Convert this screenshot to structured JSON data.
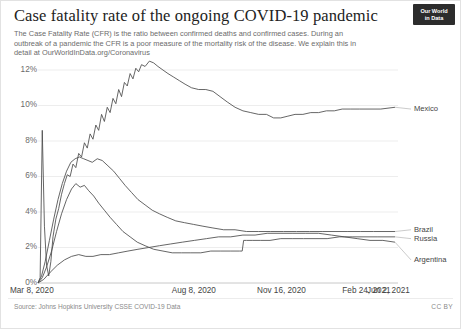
{
  "header": {
    "title": "Case fatality rate of the ongoing COVID-19 pandemic",
    "subtitle": "The Case Fatality Rate (CFR) is the ratio between confirmed deaths and confirmed cases. During an outbreak of a pandemic the CFR is a poor measure of the mortality risk of the disease. We explain this in detail at OurWorldInData.org/Coronavirus",
    "logo_line1": "Our World",
    "logo_line2": "in Data"
  },
  "footer": {
    "source": "Source: Johns Hopkins University CSSE COVID-19 Data",
    "license": "CC BY"
  },
  "chart_data": {
    "type": "line",
    "title": "Case fatality rate of the ongoing COVID-19 pandemic",
    "xlabel": "",
    "ylabel": "",
    "ylim": [
      0,
      13.2
    ],
    "grid": "horizontal",
    "legend_position": "right-of-lines",
    "ytick_labels": [
      "0%",
      "2%",
      "4%",
      "6%",
      "8%",
      "10%",
      "12%"
    ],
    "ytick_values": [
      0,
      2,
      4,
      6,
      8,
      10,
      12
    ],
    "xtick_labels": [
      "Mar 8, 2020",
      "Aug 8, 2020",
      "Nov 16, 2020",
      "Feb 24, 2021",
      "Jun 2, 2021"
    ],
    "xtick_positions": [
      0,
      0.453,
      0.692,
      0.931,
      1.0
    ],
    "color": "#4a4a4a",
    "series": [
      {
        "name": "Mexico",
        "label_y_pct": 9.8,
        "points": [
          [
            0.0,
            0.0
          ],
          [
            0.006,
            0.3
          ],
          [
            0.012,
            8.6
          ],
          [
            0.018,
            3.2
          ],
          [
            0.024,
            1.0
          ],
          [
            0.03,
            0.4
          ],
          [
            0.036,
            1.2
          ],
          [
            0.042,
            2.6
          ],
          [
            0.05,
            3.6
          ],
          [
            0.058,
            4.2
          ],
          [
            0.066,
            5.0
          ],
          [
            0.074,
            5.6
          ],
          [
            0.082,
            6.1
          ],
          [
            0.09,
            6.0
          ],
          [
            0.098,
            6.7
          ],
          [
            0.106,
            6.5
          ],
          [
            0.114,
            7.3
          ],
          [
            0.122,
            7.1
          ],
          [
            0.13,
            7.9
          ],
          [
            0.138,
            7.6
          ],
          [
            0.146,
            8.4
          ],
          [
            0.154,
            8.1
          ],
          [
            0.162,
            8.9
          ],
          [
            0.17,
            8.6
          ],
          [
            0.178,
            9.5
          ],
          [
            0.186,
            9.1
          ],
          [
            0.194,
            9.9
          ],
          [
            0.202,
            9.6
          ],
          [
            0.21,
            10.4
          ],
          [
            0.218,
            10.1
          ],
          [
            0.226,
            10.9
          ],
          [
            0.234,
            10.5
          ],
          [
            0.242,
            11.3
          ],
          [
            0.25,
            11.1
          ],
          [
            0.258,
            11.8
          ],
          [
            0.266,
            11.5
          ],
          [
            0.274,
            12.1
          ],
          [
            0.282,
            11.9
          ],
          [
            0.29,
            12.3
          ],
          [
            0.3,
            12.2
          ],
          [
            0.312,
            12.5
          ],
          [
            0.324,
            12.4
          ],
          [
            0.336,
            12.2
          ],
          [
            0.35,
            12.0
          ],
          [
            0.364,
            11.8
          ],
          [
            0.38,
            11.6
          ],
          [
            0.396,
            11.4
          ],
          [
            0.412,
            11.2
          ],
          [
            0.43,
            11.0
          ],
          [
            0.45,
            10.9
          ],
          [
            0.47,
            10.9
          ],
          [
            0.49,
            10.8
          ],
          [
            0.51,
            10.5
          ],
          [
            0.53,
            10.2
          ],
          [
            0.552,
            9.9
          ],
          [
            0.574,
            9.7
          ],
          [
            0.596,
            9.6
          ],
          [
            0.618,
            9.5
          ],
          [
            0.64,
            9.5
          ],
          [
            0.66,
            9.3
          ],
          [
            0.68,
            9.3
          ],
          [
            0.7,
            9.4
          ],
          [
            0.72,
            9.5
          ],
          [
            0.742,
            9.5
          ],
          [
            0.764,
            9.6
          ],
          [
            0.786,
            9.6
          ],
          [
            0.808,
            9.7
          ],
          [
            0.83,
            9.7
          ],
          [
            0.852,
            9.8
          ],
          [
            0.876,
            9.8
          ],
          [
            0.9,
            9.8
          ],
          [
            0.93,
            9.8
          ],
          [
            0.96,
            9.8
          ],
          [
            1.0,
            9.9
          ]
        ]
      },
      {
        "name": "Brazil",
        "label_y_pct": 3.0,
        "points": [
          [
            0.0,
            0.0
          ],
          [
            0.01,
            0.4
          ],
          [
            0.02,
            1.2
          ],
          [
            0.032,
            2.4
          ],
          [
            0.044,
            3.6
          ],
          [
            0.056,
            4.7
          ],
          [
            0.068,
            5.6
          ],
          [
            0.08,
            6.3
          ],
          [
            0.092,
            6.8
          ],
          [
            0.104,
            7.0
          ],
          [
            0.116,
            7.1
          ],
          [
            0.128,
            7.0
          ],
          [
            0.14,
            6.9
          ],
          [
            0.152,
            6.8
          ],
          [
            0.166,
            7.0
          ],
          [
            0.18,
            6.9
          ],
          [
            0.196,
            6.6
          ],
          [
            0.212,
            6.3
          ],
          [
            0.228,
            5.9
          ],
          [
            0.244,
            5.5
          ],
          [
            0.262,
            5.1
          ],
          [
            0.28,
            4.7
          ],
          [
            0.3,
            4.4
          ],
          [
            0.32,
            4.1
          ],
          [
            0.34,
            3.9
          ],
          [
            0.362,
            3.7
          ],
          [
            0.386,
            3.5
          ],
          [
            0.41,
            3.4
          ],
          [
            0.436,
            3.3
          ],
          [
            0.462,
            3.2
          ],
          [
            0.49,
            3.1
          ],
          [
            0.52,
            3.0
          ],
          [
            0.552,
            3.0
          ],
          [
            0.584,
            2.9
          ],
          [
            0.618,
            2.9
          ],
          [
            0.652,
            2.9
          ],
          [
            0.688,
            2.9
          ],
          [
            0.724,
            2.9
          ],
          [
            0.76,
            2.9
          ],
          [
            0.796,
            2.9
          ],
          [
            0.832,
            2.9
          ],
          [
            0.868,
            2.9
          ],
          [
            0.904,
            2.9
          ],
          [
            0.94,
            2.9
          ],
          [
            1.0,
            2.9
          ]
        ]
      },
      {
        "name": "Russia",
        "label_y_pct": 2.5,
        "points": [
          [
            0.0,
            0.0
          ],
          [
            0.012,
            0.3
          ],
          [
            0.024,
            0.9
          ],
          [
            0.038,
            1.8
          ],
          [
            0.052,
            2.9
          ],
          [
            0.066,
            3.9
          ],
          [
            0.08,
            4.7
          ],
          [
            0.094,
            5.3
          ],
          [
            0.106,
            5.6
          ],
          [
            0.118,
            5.4
          ],
          [
            0.13,
            5.5
          ],
          [
            0.142,
            5.2
          ],
          [
            0.156,
            4.9
          ],
          [
            0.17,
            4.5
          ],
          [
            0.186,
            4.1
          ],
          [
            0.202,
            3.7
          ],
          [
            0.22,
            3.3
          ],
          [
            0.238,
            2.9
          ],
          [
            0.258,
            2.6
          ],
          [
            0.278,
            2.3
          ],
          [
            0.3,
            2.1
          ],
          [
            0.324,
            1.9
          ],
          [
            0.35,
            1.8
          ],
          [
            0.376,
            1.7
          ],
          [
            0.402,
            1.7
          ],
          [
            0.428,
            1.7
          ],
          [
            0.456,
            1.7
          ],
          [
            0.484,
            1.8
          ],
          [
            0.512,
            1.8
          ],
          [
            0.54,
            1.8
          ],
          [
            0.564,
            1.8
          ],
          [
            0.572,
            1.8
          ],
          [
            0.576,
            2.4
          ],
          [
            0.584,
            2.4
          ],
          [
            0.6,
            2.4
          ],
          [
            0.624,
            2.4
          ],
          [
            0.65,
            2.4
          ],
          [
            0.68,
            2.5
          ],
          [
            0.712,
            2.5
          ],
          [
            0.744,
            2.5
          ],
          [
            0.776,
            2.5
          ],
          [
            0.81,
            2.5
          ],
          [
            0.844,
            2.6
          ],
          [
            0.88,
            2.6
          ],
          [
            0.916,
            2.6
          ],
          [
            0.952,
            2.6
          ],
          [
            1.0,
            2.6
          ]
        ]
      },
      {
        "name": "Argentina",
        "label_y_pct": 1.3,
        "points": [
          [
            0.0,
            0.0
          ],
          [
            0.016,
            0.2
          ],
          [
            0.034,
            0.6
          ],
          [
            0.054,
            1.0
          ],
          [
            0.074,
            1.3
          ],
          [
            0.094,
            1.5
          ],
          [
            0.114,
            1.6
          ],
          [
            0.134,
            1.5
          ],
          [
            0.154,
            1.5
          ],
          [
            0.176,
            1.6
          ],
          [
            0.2,
            1.6
          ],
          [
            0.226,
            1.7
          ],
          [
            0.252,
            1.8
          ],
          [
            0.28,
            1.9
          ],
          [
            0.31,
            2.0
          ],
          [
            0.34,
            2.1
          ],
          [
            0.372,
            2.2
          ],
          [
            0.404,
            2.3
          ],
          [
            0.438,
            2.4
          ],
          [
            0.472,
            2.5
          ],
          [
            0.506,
            2.6
          ],
          [
            0.54,
            2.6
          ],
          [
            0.574,
            2.7
          ],
          [
            0.608,
            2.7
          ],
          [
            0.642,
            2.8
          ],
          [
            0.678,
            2.8
          ],
          [
            0.714,
            2.8
          ],
          [
            0.75,
            2.8
          ],
          [
            0.786,
            2.8
          ],
          [
            0.822,
            2.7
          ],
          [
            0.858,
            2.6
          ],
          [
            0.894,
            2.5
          ],
          [
            0.93,
            2.4
          ],
          [
            0.966,
            2.4
          ],
          [
            1.0,
            2.3
          ]
        ]
      }
    ]
  }
}
